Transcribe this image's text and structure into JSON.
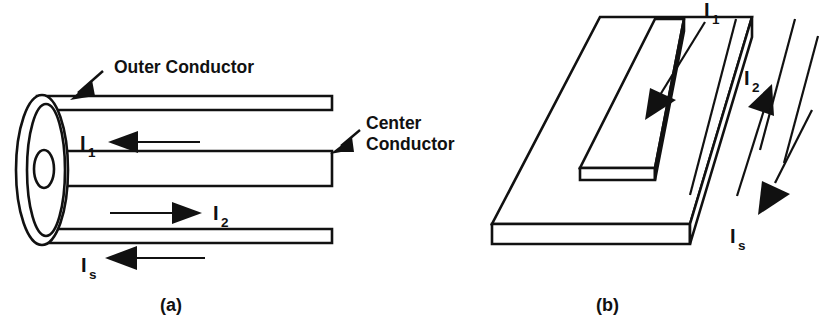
{
  "figure": {
    "background_color": "#ffffff",
    "line_color": "#111111",
    "panels": [
      {
        "id": "a",
        "caption": "(a)",
        "type": "coaxial-line-cutaway",
        "annotations": [
          {
            "name": "outer-conductor",
            "text": "Outer Conductor",
            "has_leader_arrow": true
          },
          {
            "name": "center-conductor-line1",
            "text": "Center",
            "has_leader_arrow": true
          },
          {
            "name": "center-conductor-line2",
            "text": "Conductor",
            "has_leader_arrow": false
          }
        ],
        "currents": [
          {
            "name": "i1",
            "symbol": "I",
            "subscript": "1",
            "direction": "left"
          },
          {
            "name": "i2",
            "symbol": "I",
            "subscript": "2",
            "direction": "right"
          },
          {
            "name": "is",
            "symbol": "I",
            "subscript": "s",
            "direction": "left"
          }
        ]
      },
      {
        "id": "b",
        "caption": "(b)",
        "type": "microstrip-line-isometric",
        "annotations": [],
        "currents": [
          {
            "name": "i1",
            "symbol": "I",
            "subscript": "1",
            "direction": "down-right"
          },
          {
            "name": "i2",
            "symbol": "I",
            "subscript": "2",
            "direction": "up-left"
          },
          {
            "name": "is",
            "symbol": "I",
            "subscript": "s",
            "direction": "down-right"
          }
        ]
      }
    ]
  }
}
